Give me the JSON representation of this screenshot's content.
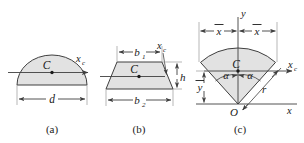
{
  "figure": {
    "title_implicit": "Centroids of common shapes",
    "background_color": "#ffffff",
    "line_color": "#3f3f3f",
    "fill_color": "#e2e2e2",
    "text_color": "#1a1a1a",
    "panels": [
      {
        "id": "a",
        "caption": "(a)",
        "shape": "semicircle",
        "labels": {
          "centroid": "C",
          "centroidal_axis": "x",
          "centroidal_axis_sub": "c",
          "width_dimension": "d"
        }
      },
      {
        "id": "b",
        "caption": "(b)",
        "shape": "trapezoid",
        "labels": {
          "centroid": "C",
          "centroidal_axis": "x",
          "centroidal_axis_sub": "c",
          "top_width": "b",
          "top_width_sub": "1",
          "bottom_width": "b",
          "bottom_width_sub": "2",
          "height": "h"
        }
      },
      {
        "id": "c",
        "caption": "(c)",
        "shape": "circular-sector",
        "labels": {
          "centroid": "C",
          "centroidal_axis": "x",
          "centroidal_axis_sub": "c",
          "origin": "O",
          "axis_x": "x",
          "axis_y": "y",
          "radius": "r",
          "half_angle_left": "α",
          "half_angle_right": "α",
          "xbar_left": "x",
          "xbar_right": "x",
          "ybar": "y"
        }
      }
    ]
  }
}
